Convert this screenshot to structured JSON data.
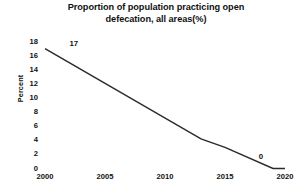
{
  "chart_data": {
    "type": "line",
    "title": "Proportion of population practicing open defecation, all areas(%)",
    "title_line1": "Proportion of population practicing open",
    "title_line2": "defecation, all areas(%)",
    "xlabel": "",
    "ylabel": "Percent",
    "xlim": [
      2000,
      2020
    ],
    "ylim": [
      0,
      18
    ],
    "ytick_step": 2,
    "grid": false,
    "legend": false,
    "legend_position": "none",
    "line_color": "#2b2b2b",
    "background_color": "#ffffff",
    "yticks": [
      "18",
      "16",
      "14",
      "12",
      "10",
      "8",
      "6",
      "4",
      "2",
      "0"
    ],
    "ytick_values": [
      18,
      16,
      14,
      12,
      10,
      8,
      6,
      4,
      2,
      0
    ],
    "xticks": [
      "2000",
      "2005",
      "2010",
      "2015",
      "2020"
    ],
    "xtick_values": [
      2000,
      2005,
      2010,
      2015,
      2020
    ],
    "x": [
      2000,
      2013,
      2015,
      2019,
      2020
    ],
    "values": [
      17,
      4.2,
      3.0,
      0,
      0
    ],
    "series": [
      {
        "name": "Open defecation",
        "x": [
          2000,
          2013,
          2015,
          2019,
          2020
        ],
        "values": [
          17,
          4.2,
          3.0,
          0,
          0
        ]
      }
    ],
    "annotations": [
      {
        "text": "17",
        "x": 2002.4,
        "y": 17.6
      },
      {
        "text": "0",
        "y": 1.6,
        "x": 2018.0
      }
    ]
  }
}
